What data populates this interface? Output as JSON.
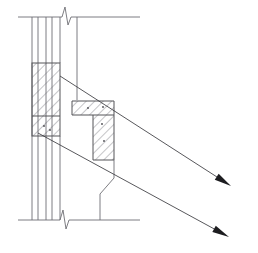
{
  "document": {
    "title": "Wall Section Detail",
    "type": "technical-section-drawing",
    "canvas": {
      "width": 258,
      "height": 253,
      "background": "#ffffff"
    }
  },
  "style": {
    "line_color": "#6e6e74",
    "outline_color": "#555559",
    "hatch_color": "#66666c",
    "leader_color": "#3a3a3e",
    "arrow_fill": "#1d1d20"
  },
  "geometry": {
    "slab_top": {
      "name": "upper-slab-edge",
      "y": 17,
      "x_start": 18,
      "x_end": 140
    },
    "slab_bottom": {
      "name": "lower-slab-edge",
      "y": 220,
      "x_start": 18,
      "x_end": 140
    },
    "break_symbols": [
      {
        "name": "break-top",
        "cx": 66,
        "cy": 17
      },
      {
        "name": "break-bottom",
        "cx": 64,
        "cy": 220
      }
    ],
    "wall_verticals": [
      {
        "name": "wall-line-1",
        "x": 32,
        "y_start": 17,
        "y_end": 220
      },
      {
        "name": "wall-line-2",
        "x": 38,
        "y_start": 17,
        "y_end": 220
      },
      {
        "name": "wall-line-3",
        "x": 46,
        "y_start": 17,
        "y_end": 220
      },
      {
        "name": "wall-line-4",
        "x": 52,
        "y_start": 17,
        "y_end": 220
      }
    ],
    "structure_vertical": {
      "name": "structure-right-edge",
      "x": 77,
      "y_start": 17,
      "y_end": 100
    },
    "hatched_column": {
      "name": "hatched-column-block",
      "x": 32,
      "y": 63,
      "width": 28,
      "height": 73,
      "divider_y": 116
    },
    "hatched_tee": {
      "name": "hatched-tee-section",
      "flange": {
        "x": 72,
        "y": 101,
        "width": 42,
        "height": 14
      },
      "web": {
        "x": 93,
        "y": 115,
        "width": 21,
        "height": 45
      }
    },
    "stepped_profile": {
      "name": "stepped-base-profile",
      "points": "114,160 114,178 100,194 100,220"
    },
    "leaders": [
      {
        "name": "leader-upper",
        "x1": 60,
        "y1": 76,
        "x2": 231,
        "y2": 186,
        "label": ""
      },
      {
        "name": "leader-lower",
        "x1": 38,
        "y1": 133,
        "x2": 229,
        "y2": 237,
        "label": ""
      }
    ],
    "annotation_dots": [
      {
        "name": "hatch-dot-1",
        "cx": 44,
        "cy": 126
      },
      {
        "name": "hatch-dot-2",
        "cx": 50,
        "cy": 130
      },
      {
        "name": "hatch-dot-3",
        "cx": 88,
        "cy": 108
      },
      {
        "name": "hatch-dot-4",
        "cx": 103,
        "cy": 107
      },
      {
        "name": "hatch-dot-5",
        "cx": 102,
        "cy": 124
      },
      {
        "name": "hatch-dot-6",
        "cx": 104,
        "cy": 141
      }
    ]
  },
  "labels": {
    "none_visible": ""
  }
}
